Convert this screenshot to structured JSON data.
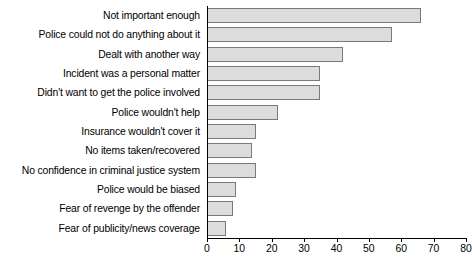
{
  "chart_data": {
    "type": "bar",
    "orientation": "horizontal",
    "title": "",
    "xlabel": "",
    "ylabel": "",
    "xlim": [
      0,
      80
    ],
    "xticks": [
      0,
      10,
      20,
      30,
      40,
      50,
      60,
      70,
      80
    ],
    "grid": false,
    "legend": null,
    "bar_color": "#dcdcdc",
    "bar_edge_color": "#7a7a7a",
    "categories": [
      "Not important enough",
      "Police could not do anything about it",
      "Dealt with another way",
      "Incident was a personal matter",
      "Didn't want to get the police involved",
      "Police wouldn't help",
      "Insurance wouldn't cover it",
      "No items taken/recovered",
      "No confidence in criminal justice system",
      "Police would be biased",
      "Fear of revenge by the offender",
      "Fear of publicity/news coverage"
    ],
    "values": [
      66,
      57,
      42,
      35,
      35,
      22,
      15,
      14,
      15,
      9,
      8,
      6
    ]
  }
}
